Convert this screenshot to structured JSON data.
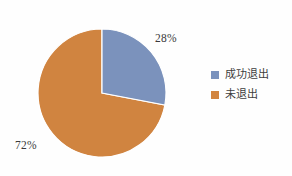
{
  "chart_data": {
    "type": "pie",
    "title": "",
    "subtitle": "",
    "xlabel": "",
    "ylabel": "",
    "categories": [
      "成功退出",
      "未退出"
    ],
    "values": [
      28,
      72
    ],
    "value_labels": [
      "28%",
      "72%"
    ],
    "unit": "%",
    "colors": [
      "#7A92BD",
      "#D2843E"
    ],
    "start_angle_deg": 0,
    "direction": "clockwise",
    "legend_position": "right",
    "grid": false,
    "background": "#FFFFFF",
    "label_color": "#3A3A3A"
  },
  "labels": {
    "blue_slice": "28%",
    "orange_slice": "72%"
  },
  "legend": {
    "items": [
      {
        "label": "成功退出",
        "color": "#7A92BD"
      },
      {
        "label": "未退出",
        "color": "#D2843E"
      }
    ]
  }
}
